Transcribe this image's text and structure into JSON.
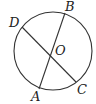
{
  "diagram": {
    "type": "circle-with-two-chords",
    "circle": {
      "center_label": "O",
      "cx": 53,
      "cy": 51,
      "r": 39
    },
    "points": {
      "A": {
        "label": "A",
        "x": 39,
        "y": 89
      },
      "B": {
        "label": "B",
        "x": 65,
        "y": 13
      },
      "C": {
        "label": "C",
        "x": 76,
        "y": 82
      },
      "D": {
        "label": "D",
        "x": 22,
        "y": 27
      },
      "O": {
        "label": "O",
        "x": 51,
        "y": 50
      }
    },
    "segments": [
      {
        "name": "AB",
        "from": "A",
        "to": "B"
      },
      {
        "name": "DC",
        "from": "D",
        "to": "C"
      }
    ],
    "colors": {
      "stroke": "#333333",
      "text": "#222222",
      "background": "#ffffff"
    }
  }
}
